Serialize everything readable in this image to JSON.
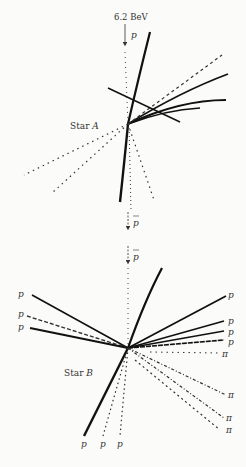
{
  "figure": {
    "beam_energy_label": "6.2 BeV",
    "beam_particle_label": "p",
    "antiproton_label": "p",
    "star_a": {
      "label_prefix": "Star",
      "label_letter": "A",
      "vertex": [
        128,
        124
      ],
      "tracks": [
        {
          "type": "heavy",
          "to": [
            150,
            32
          ]
        },
        {
          "type": "heavy",
          "to": [
            228,
            74
          ]
        },
        {
          "type": "heavy",
          "to": [
            226,
            100
          ]
        },
        {
          "type": "heavy",
          "to": [
            108,
            88
          ],
          "via_to": [
            180,
            122
          ]
        },
        {
          "type": "dotted",
          "to": [
            222,
            55
          ]
        },
        {
          "type": "dotted",
          "to": [
            24,
            175
          ]
        },
        {
          "type": "dotted",
          "to": [
            52,
            193
          ]
        },
        {
          "type": "heavy",
          "to": [
            120,
            200
          ]
        },
        {
          "type": "dotted",
          "to": [
            154,
            200
          ]
        },
        {
          "type": "dotted",
          "to": [
            130,
            210
          ]
        }
      ]
    },
    "star_b": {
      "label_prefix": "Star",
      "label_letter": "B",
      "vertex": [
        128,
        348
      ],
      "left_labels": [
        "p",
        "p",
        "p"
      ],
      "right_labels": [
        "p",
        "p",
        "p",
        "p",
        "π",
        "π",
        "π",
        "π"
      ],
      "bottom_labels": [
        "p",
        "p",
        "p"
      ]
    }
  }
}
